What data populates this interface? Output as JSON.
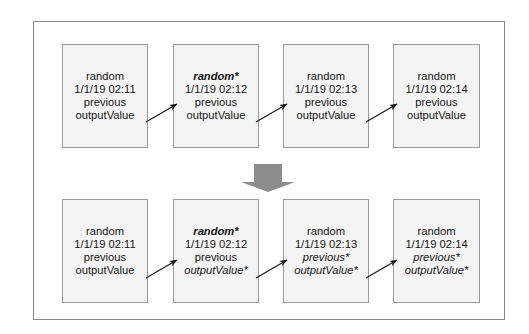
{
  "diagram": {
    "frame_color": "#8a8a8a",
    "box_fill": "#f4f4f4",
    "box_border": "#9a9a9a",
    "connector_color": "#1a1a1a",
    "big_arrow_color": "#8c8c8c",
    "big_arrow_name": "down-block-arrow",
    "rows": [
      {
        "name": "before-row",
        "boxes": [
          {
            "name": "record-box-1",
            "lines": [
              {
                "text": "random",
                "style": "normal"
              },
              {
                "text": "1/1/19 02:11",
                "style": "normal"
              },
              {
                "text": "previous",
                "style": "normal"
              },
              {
                "text": "outputValue",
                "style": "normal"
              }
            ]
          },
          {
            "name": "record-box-2",
            "lines": [
              {
                "text": "random*",
                "style": "bold-italic"
              },
              {
                "text": "1/1/19 02:12",
                "style": "normal"
              },
              {
                "text": "previous",
                "style": "normal"
              },
              {
                "text": "outputValue",
                "style": "normal"
              }
            ]
          },
          {
            "name": "record-box-3",
            "lines": [
              {
                "text": "random",
                "style": "normal"
              },
              {
                "text": "1/1/19 02:13",
                "style": "normal"
              },
              {
                "text": "previous",
                "style": "normal"
              },
              {
                "text": "outputValue",
                "style": "normal"
              }
            ]
          },
          {
            "name": "record-box-4",
            "lines": [
              {
                "text": "random",
                "style": "normal"
              },
              {
                "text": "1/1/19 02:14",
                "style": "normal"
              },
              {
                "text": "previous",
                "style": "normal"
              },
              {
                "text": "outputValue",
                "style": "normal"
              }
            ]
          }
        ]
      },
      {
        "name": "after-row",
        "boxes": [
          {
            "name": "record-box-5",
            "lines": [
              {
                "text": "random",
                "style": "normal"
              },
              {
                "text": "1/1/19 02:11",
                "style": "normal"
              },
              {
                "text": "previous",
                "style": "normal"
              },
              {
                "text": "outputValue",
                "style": "normal"
              }
            ]
          },
          {
            "name": "record-box-6",
            "lines": [
              {
                "text": "random*",
                "style": "bold-italic"
              },
              {
                "text": "1/1/19 02:12",
                "style": "normal"
              },
              {
                "text": "previous",
                "style": "normal"
              },
              {
                "text": "outputValue*",
                "style": "italic"
              }
            ]
          },
          {
            "name": "record-box-7",
            "lines": [
              {
                "text": "random",
                "style": "normal"
              },
              {
                "text": "1/1/19 02:13",
                "style": "normal"
              },
              {
                "text": "previous*",
                "style": "italic"
              },
              {
                "text": "outputValue*",
                "style": "italic"
              }
            ]
          },
          {
            "name": "record-box-8",
            "lines": [
              {
                "text": "random",
                "style": "normal"
              },
              {
                "text": "1/1/19 02:14",
                "style": "normal"
              },
              {
                "text": "previous*",
                "style": "italic"
              },
              {
                "text": "outputValue*",
                "style": "italic"
              }
            ]
          }
        ]
      }
    ]
  }
}
